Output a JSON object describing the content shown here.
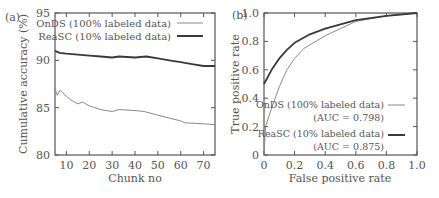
{
  "chart_data": [
    {
      "panel": "(a)",
      "type": "line",
      "title": "",
      "xlabel": "Chunk no",
      "ylabel": "Cumulative accuracy (%)",
      "xlim": [
        5,
        75
      ],
      "ylim": [
        80,
        95
      ],
      "xticks": [
        10,
        20,
        30,
        40,
        50,
        60,
        70
      ],
      "yticks": [
        80,
        85,
        90,
        95
      ],
      "grid": false,
      "legend_position": "upper right",
      "series": [
        {
          "name": "OnDS (100% labeled data)",
          "style": "thin gray",
          "x": [
            5,
            6,
            7,
            8,
            9,
            10,
            12,
            15,
            17,
            20,
            25,
            30,
            33,
            40,
            44,
            50,
            55,
            60,
            62,
            70,
            75
          ],
          "y": [
            87.0,
            86.3,
            86.8,
            86.7,
            86.4,
            86.2,
            85.8,
            85.4,
            85.6,
            85.2,
            84.8,
            84.6,
            84.8,
            84.7,
            84.6,
            84.2,
            83.9,
            83.6,
            83.4,
            83.3,
            83.2
          ]
        },
        {
          "name": "ReaSC (10% labeled data)",
          "style": "thick dark",
          "x": [
            5,
            7,
            10,
            15,
            20,
            25,
            30,
            33,
            40,
            45,
            50,
            55,
            60,
            65,
            70,
            75
          ],
          "y": [
            91.0,
            90.8,
            90.7,
            90.6,
            90.5,
            90.4,
            90.3,
            90.4,
            90.3,
            90.4,
            90.2,
            90.0,
            89.8,
            89.6,
            89.4,
            89.4
          ]
        }
      ]
    },
    {
      "panel": "(b)",
      "type": "line",
      "title": "",
      "xlabel": "False positive rate",
      "ylabel": "True positive rate",
      "xlim": [
        0,
        1
      ],
      "ylim": [
        0,
        1
      ],
      "xticks": [
        0,
        0.2,
        0.4,
        0.6,
        0.8,
        1.0
      ],
      "yticks": [
        0,
        0.2,
        0.4,
        0.6,
        0.8,
        1.0
      ],
      "grid": false,
      "legend_position": "lower right",
      "series": [
        {
          "name": "OnDS (100% labeled data)",
          "annotation": "(AUC = 0.798)",
          "style": "thin gray",
          "x": [
            0,
            0.01,
            0.05,
            0.1,
            0.15,
            0.2,
            0.26,
            0.4,
            0.6,
            0.8,
            1.0
          ],
          "y": [
            0,
            0.2,
            0.33,
            0.48,
            0.6,
            0.68,
            0.75,
            0.84,
            0.94,
            0.98,
            1.0
          ]
        },
        {
          "name": "ReaSC (10% labeled data)",
          "annotation": "(AUC = 0.875)",
          "style": "thick dark",
          "x": [
            0,
            0.05,
            0.1,
            0.15,
            0.2,
            0.3,
            0.4,
            0.5,
            0.6,
            0.8,
            1.0
          ],
          "y": [
            0.5,
            0.6,
            0.68,
            0.74,
            0.79,
            0.85,
            0.89,
            0.92,
            0.95,
            0.98,
            1.0
          ]
        }
      ]
    }
  ],
  "left": {
    "panel_label": "(a)",
    "xlabel": "Chunk no",
    "ylabel": "Cumulative accuracy (%)",
    "xticks": [
      "10",
      "20",
      "30",
      "40",
      "50",
      "60",
      "70"
    ],
    "yticks": [
      "80",
      "85",
      "90",
      "95"
    ],
    "legend": [
      "OnDS (100% labeled data)",
      "ReaSC (10% labeled data)"
    ]
  },
  "right": {
    "panel_label": "(b)",
    "xlabel": "False positive rate",
    "ylabel": "True positive rate",
    "xticks": [
      "0",
      "0.2",
      "0.4",
      "0.6",
      "0.8",
      "1.0"
    ],
    "yticks": [
      "0",
      "0.2",
      "0.4",
      "0.6",
      "0.8",
      "1.0"
    ],
    "legend": [
      {
        "name": "OnDS (100% labeled data)",
        "auc": "(AUC = 0.798)"
      },
      {
        "name": "ReaSC (10% labeled data)",
        "auc": "(AUC = 0.875)"
      }
    ]
  },
  "colors": {
    "onds": "#8a8a8a",
    "reasc": "#3a3a3a",
    "axis": "#555555"
  }
}
